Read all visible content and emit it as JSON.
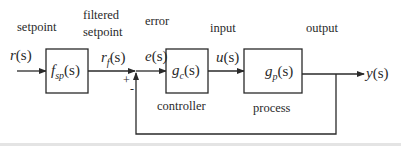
{
  "diagram": {
    "type": "feedback-control-block-diagram",
    "labels": {
      "setpoint": "setpoint",
      "filtered_line1": "filtered",
      "filtered_line2": "setpoint",
      "error": "error",
      "input": "input",
      "output": "output",
      "controller": "controller",
      "process": "process"
    },
    "signals": {
      "r": {
        "name": "r",
        "arg": "(s)"
      },
      "rf": {
        "name": "r",
        "sub": "f",
        "arg": "(s)"
      },
      "e": {
        "name": "e",
        "arg": "(s)"
      },
      "u": {
        "name": "u",
        "arg": "(s)"
      },
      "y": {
        "name": "y",
        "arg": "(s)"
      }
    },
    "blocks": {
      "fsp": {
        "name": "f",
        "sub": "sp",
        "arg": "(s)"
      },
      "gc": {
        "name": "g",
        "sub": "c",
        "arg": "(s)"
      },
      "gp": {
        "name": "g",
        "sub": "p",
        "arg": "(s)"
      }
    },
    "summing_junction": {
      "plus": "+",
      "minus": "-"
    },
    "colors": {
      "line": "#2a2a2a",
      "background": "#ffffff",
      "strip": "#e4e4e4"
    }
  }
}
